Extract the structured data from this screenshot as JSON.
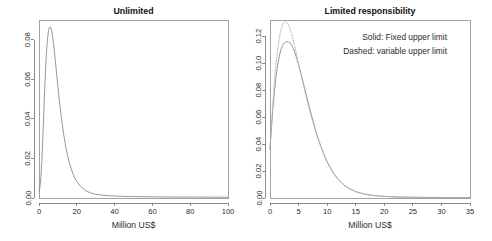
{
  "figure": {
    "background_color": "#ffffff",
    "layout": "two-panels-side-by-side",
    "solid_color": "#8c8c8c",
    "dashed_color": "#b4b4b4"
  },
  "chart_data": [
    {
      "type": "line",
      "panel_id": "unlimited",
      "title": "Unlimited",
      "xlabel": "Million US$",
      "ylabel": "",
      "xlim": [
        0,
        100
      ],
      "ylim": [
        0,
        0.09
      ],
      "grid": false,
      "legend": null,
      "xticks": [
        0,
        20,
        40,
        60,
        80,
        100
      ],
      "xtick_labels": [
        "0",
        "20",
        "40",
        "60",
        "80",
        "100"
      ],
      "yticks": [
        0.0,
        0.02,
        0.04,
        0.06,
        0.08
      ],
      "ytick_labels": [
        "0.00",
        "0.02",
        "0.04",
        "0.06",
        "0.08"
      ],
      "series": [
        {
          "name": "Unlimited loss distribution",
          "style": "solid",
          "x": [
            0.0,
            0.5,
            1.0,
            1.5,
            2.0,
            2.5,
            3.0,
            3.5,
            4.0,
            4.5,
            5.0,
            5.5,
            6.0,
            6.5,
            7.0,
            7.5,
            8.0,
            9.0,
            10.0,
            11.0,
            12.0,
            13.0,
            14.0,
            15.0,
            16.0,
            17.0,
            18.0,
            19.0,
            20.0,
            22.0,
            24.0,
            26.0,
            28.0,
            30.0,
            32.0,
            35.0,
            40.0,
            45.0,
            50.0,
            60.0,
            70.0,
            80.0,
            90.0,
            100.0
          ],
          "y": [
            0.0035,
            0.0055,
            0.0105,
            0.0185,
            0.0295,
            0.042,
            0.0545,
            0.0655,
            0.0745,
            0.0805,
            0.0845,
            0.0862,
            0.0865,
            0.0855,
            0.083,
            0.0795,
            0.0755,
            0.066,
            0.0565,
            0.0475,
            0.0395,
            0.0325,
            0.0268,
            0.022,
            0.018,
            0.0148,
            0.0122,
            0.0101,
            0.0084,
            0.0059,
            0.0042,
            0.0031,
            0.0024,
            0.0019,
            0.0016,
            0.0013,
            0.001,
            0.0008,
            0.0007,
            0.0006,
            0.0005,
            0.0005,
            0.0004,
            0.0004
          ]
        }
      ]
    },
    {
      "type": "line",
      "panel_id": "limited-responsibility",
      "title": "Limited responsibility",
      "xlabel": "Million US$",
      "ylabel": "",
      "xlim": [
        0,
        35
      ],
      "ylim": [
        0,
        0.132
      ],
      "grid": false,
      "legend": "inset-text",
      "xticks": [
        0,
        5,
        10,
        15,
        20,
        25,
        30,
        35
      ],
      "xtick_labels": [
        "0",
        "5",
        "10",
        "15",
        "20",
        "25",
        "30",
        "35"
      ],
      "yticks": [
        0.0,
        0.02,
        0.04,
        0.06,
        0.08,
        0.1,
        0.12
      ],
      "ytick_labels": [
        "0.00",
        "0.02",
        "0.04",
        "0.06",
        "0.08",
        "0.10",
        "0.12"
      ],
      "annotations": [
        "Solid: Fixed upper limit",
        "Dashed: variable upper limit"
      ],
      "series": [
        {
          "name": "Fixed upper limit",
          "style": "solid",
          "x": [
            0.0,
            0.25,
            0.5,
            0.75,
            1.0,
            1.25,
            1.5,
            1.75,
            2.0,
            2.25,
            2.5,
            2.75,
            3.0,
            3.25,
            3.5,
            3.75,
            4.0,
            4.25,
            4.5,
            5.0,
            5.5,
            6.0,
            6.5,
            7.0,
            7.5,
            8.0,
            8.5,
            9.0,
            9.5,
            10.0,
            11.0,
            12.0,
            13.0,
            14.0,
            15.0,
            16.0,
            17.0,
            18.0,
            19.0,
            20.0,
            22.0,
            24.0,
            26.0,
            28.0,
            30.0,
            32.0,
            35.0
          ],
          "y": [
            0.0365,
            0.052,
            0.066,
            0.078,
            0.088,
            0.096,
            0.1025,
            0.1075,
            0.111,
            0.1135,
            0.115,
            0.1158,
            0.116,
            0.1157,
            0.115,
            0.1135,
            0.1115,
            0.109,
            0.106,
            0.099,
            0.091,
            0.0825,
            0.074,
            0.0655,
            0.0575,
            0.05,
            0.0432,
            0.037,
            0.0315,
            0.0267,
            0.019,
            0.0134,
            0.0094,
            0.0066,
            0.0047,
            0.0034,
            0.0025,
            0.0019,
            0.0015,
            0.0012,
            0.0008,
            0.0006,
            0.0005,
            0.0004,
            0.0004,
            0.0003,
            0.0003
          ]
        },
        {
          "name": "Variable upper limit",
          "style": "dashed",
          "x": [
            0.0,
            0.25,
            0.5,
            0.75,
            1.0,
            1.25,
            1.5,
            1.75,
            2.0,
            2.25,
            2.5,
            2.75,
            3.0,
            3.25,
            3.5,
            3.75,
            4.0,
            4.25,
            4.5,
            5.0,
            5.5,
            6.0,
            6.5,
            7.0,
            7.5,
            8.0,
            8.5,
            9.0,
            9.5,
            10.0,
            11.0,
            12.0,
            13.0,
            14.0,
            15.0,
            16.0,
            17.0,
            18.0,
            19.0,
            20.0,
            22.0,
            24.0,
            26.0,
            28.0,
            30.0,
            32.0,
            35.0
          ],
          "y": [
            0.0365,
            0.054,
            0.07,
            0.0845,
            0.097,
            0.107,
            0.115,
            0.1215,
            0.126,
            0.129,
            0.1305,
            0.1308,
            0.13,
            0.1283,
            0.1258,
            0.1225,
            0.1185,
            0.114,
            0.1092,
            0.0995,
            0.0898,
            0.0808,
            0.072,
            0.0638,
            0.0562,
            0.0492,
            0.0428,
            0.037,
            0.0318,
            0.0271,
            0.0194,
            0.0137,
            0.0096,
            0.0068,
            0.0048,
            0.0035,
            0.0026,
            0.002,
            0.0015,
            0.0012,
            0.0008,
            0.0006,
            0.0005,
            0.0004,
            0.0004,
            0.0003,
            0.0003
          ]
        }
      ]
    }
  ]
}
